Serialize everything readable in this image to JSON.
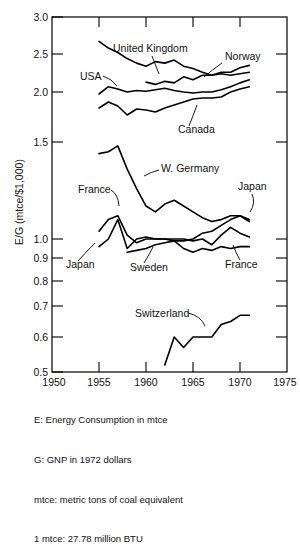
{
  "chart_data": {
    "type": "line",
    "title": "",
    "xlabel": "",
    "ylabel": "E/G (mtce/$1,000)",
    "xlim": [
      1950,
      1975
    ],
    "xticks": [
      1950,
      1955,
      1960,
      1965,
      1970,
      1975
    ],
    "xtick_labels": [
      "1950",
      "1955",
      "1960",
      "1965",
      "1970",
      "1975"
    ],
    "yticks": [
      0.5,
      0.6,
      0.7,
      0.8,
      0.9,
      1.0,
      1.5,
      2.0,
      2.5,
      3.0
    ],
    "ytick_labels": [
      "0.5",
      "0.6",
      "0.7",
      "0.8",
      "0.9",
      "1.0",
      "1.5",
      "2.0",
      "2.5",
      "3.0"
    ],
    "y_axis_note": "non-linear: 0.5-1.0 expanded, 1.0-3.0 compressed",
    "grid": false,
    "legend": "inline-annotations",
    "series": [
      {
        "name": "United Kingdom",
        "label": "United Kingdom",
        "x": [
          1955,
          1956,
          1957,
          1958,
          1959,
          1960,
          1961,
          1962,
          1963,
          1964,
          1965,
          1966,
          1967,
          1968,
          1969,
          1970,
          1971
        ],
        "values": [
          2.67,
          2.58,
          2.52,
          2.44,
          2.38,
          2.34,
          2.4,
          2.38,
          2.42,
          2.34,
          2.31,
          2.26,
          2.22,
          2.24,
          2.22,
          2.24,
          2.26
        ]
      },
      {
        "name": "Norway",
        "label": "Norway",
        "x": [
          1960,
          1961,
          1962,
          1963,
          1964,
          1965,
          1966,
          1967,
          1968,
          1969,
          1970,
          1971
        ],
        "values": [
          2.13,
          2.1,
          2.14,
          2.12,
          2.2,
          2.16,
          2.22,
          2.22,
          2.26,
          2.26,
          2.32,
          2.35
        ]
      },
      {
        "name": "USA",
        "label": "USA",
        "x": [
          1955,
          1956,
          1957,
          1958,
          1959,
          1960,
          1961,
          1962,
          1963,
          1964,
          1965,
          1966,
          1967,
          1968,
          1969,
          1970,
          1971
        ],
        "values": [
          1.98,
          2.07,
          2.04,
          2.0,
          2.02,
          2.01,
          2.03,
          2.05,
          2.02,
          2.0,
          1.99,
          2.0,
          2.0,
          2.03,
          2.07,
          2.12,
          2.16
        ]
      },
      {
        "name": "Canada",
        "label": "Canada",
        "x": [
          1955,
          1956,
          1957,
          1958,
          1959,
          1960,
          1961,
          1962,
          1963,
          1964,
          1965,
          1966,
          1967,
          1968,
          1969,
          1970,
          1971
        ],
        "values": [
          1.84,
          1.9,
          1.86,
          1.77,
          1.83,
          1.82,
          1.8,
          1.84,
          1.87,
          1.9,
          1.93,
          1.94,
          1.94,
          1.95,
          2.0,
          2.04,
          2.07
        ]
      },
      {
        "name": "W. Germany",
        "label": "W. Germany",
        "x": [
          1955,
          1956,
          1957,
          1958,
          1959,
          1960,
          1961,
          1962,
          1963,
          1964,
          1965,
          1966,
          1967,
          1968,
          1969,
          1970,
          1971
        ],
        "values": [
          1.44,
          1.45,
          1.48,
          1.36,
          1.26,
          1.17,
          1.14,
          1.18,
          1.2,
          1.17,
          1.14,
          1.11,
          1.09,
          1.1,
          1.12,
          1.12,
          1.1
        ]
      },
      {
        "name": "France",
        "label": "France",
        "x": [
          1955,
          1956,
          1957,
          1958,
          1959,
          1960,
          1961,
          1962,
          1963,
          1964,
          1965,
          1966,
          1967,
          1968,
          1969,
          1970,
          1971
        ],
        "values": [
          1.04,
          1.1,
          1.12,
          1.02,
          0.98,
          1.0,
          1.0,
          1.0,
          1.0,
          1.0,
          0.99,
          1.0,
          0.97,
          1.02,
          1.06,
          1.03,
          1.01
        ]
      },
      {
        "name": "Japan",
        "label": "Japan",
        "x": [
          1955,
          1956,
          1957,
          1958,
          1959,
          1960,
          1961,
          1962,
          1963,
          1964,
          1965,
          1966,
          1967,
          1968,
          1969,
          1970,
          1971
        ],
        "values": [
          0.96,
          1.0,
          1.1,
          0.95,
          1.0,
          1.01,
          1.0,
          1.0,
          0.99,
          0.99,
          1.0,
          1.03,
          1.04,
          1.07,
          1.1,
          1.12,
          1.09
        ]
      },
      {
        "name": "Sweden",
        "label": "Sweden",
        "x": [
          1958,
          1959,
          1960,
          1961,
          1962,
          1963,
          1964,
          1965,
          1966,
          1967,
          1968,
          1969,
          1970,
          1971
        ],
        "values": [
          0.93,
          0.94,
          0.95,
          0.97,
          0.98,
          0.99,
          0.95,
          0.93,
          0.95,
          0.94,
          0.96,
          0.95,
          0.96,
          0.96
        ]
      },
      {
        "name": "Switzerland",
        "label": "Switzerland",
        "x": [
          1962,
          1963,
          1964,
          1965,
          1966,
          1967,
          1968,
          1969,
          1970,
          1971
        ],
        "values": [
          0.52,
          0.6,
          0.57,
          0.6,
          0.6,
          0.6,
          0.64,
          0.65,
          0.67,
          0.67
        ]
      }
    ],
    "annotations": [
      {
        "text": "United Kingdom",
        "name": "label-united-kingdom"
      },
      {
        "text": "Norway",
        "name": "label-norway"
      },
      {
        "text": "USA",
        "name": "label-usa"
      },
      {
        "text": "Canada",
        "name": "label-canada"
      },
      {
        "text": "W. Germany",
        "name": "label-w-germany"
      },
      {
        "text": "France",
        "name": "label-france-upper"
      },
      {
        "text": "Japan",
        "name": "label-japan-right"
      },
      {
        "text": "Japan",
        "name": "label-japan-left"
      },
      {
        "text": "Sweden",
        "name": "label-sweden"
      },
      {
        "text": "France",
        "name": "label-france-lower"
      },
      {
        "text": "Switzerland",
        "name": "label-switzerland"
      }
    ]
  },
  "labels": {
    "united_kingdom": "United Kingdom",
    "norway": "Norway",
    "usa": "USA",
    "canada": "Canada",
    "w_germany": "W. Germany",
    "france_upper": "France",
    "japan_right": "Japan",
    "japan_left": "Japan",
    "sweden": "Sweden",
    "france_lower": "France",
    "switzerland": "Switzerland"
  },
  "yaxis": {
    "title": "E/G (mtce/$1,000)",
    "t30": "3.0",
    "t25": "2.5",
    "t20": "2.0",
    "t15": "1.5",
    "t10": "1.0",
    "t09": "0.9",
    "t08": "0.8",
    "t07": "0.7",
    "t06": "0.6",
    "t05": "0.5"
  },
  "xaxis": {
    "y1950": "1950",
    "y1955": "1955",
    "y1960": "1960",
    "y1965": "1965",
    "y1970": "1970",
    "y1975": "1975"
  },
  "notes": {
    "line1": "E: Energy Consumption in mtce",
    "line2": "G: GNP in 1972 dollars",
    "line3": "mtce: metric tons of coal equivalent",
    "line4": "1 mtce: 27.78 million BTU"
  },
  "colors": {
    "line": "#000000",
    "frame": "#000000",
    "background": "#ffffff"
  }
}
